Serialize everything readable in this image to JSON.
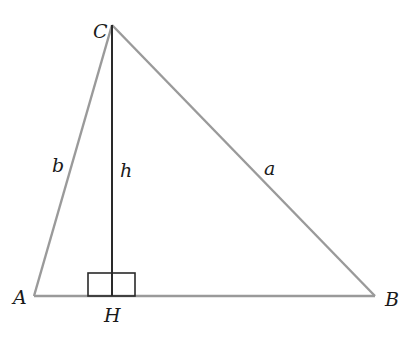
{
  "diagram": {
    "type": "triangle-altitude",
    "vertices": {
      "A": {
        "label": "A",
        "x": 34,
        "y": 296
      },
      "B": {
        "label": "B",
        "x": 375,
        "y": 296
      },
      "C": {
        "label": "C",
        "x": 112,
        "y": 25
      },
      "H": {
        "label": "H",
        "x": 112,
        "y": 296
      }
    },
    "sides": {
      "a": {
        "label": "a",
        "from": "C",
        "to": "B"
      },
      "b": {
        "label": "b",
        "from": "A",
        "to": "C"
      },
      "h": {
        "label": "h",
        "from": "C",
        "to": "H"
      }
    },
    "right_angle_marker": {
      "at": "H"
    },
    "colors": {
      "triangle": "#9a9a9a",
      "altitude": "#2a2a2a",
      "text": "#1a1a1a"
    }
  }
}
